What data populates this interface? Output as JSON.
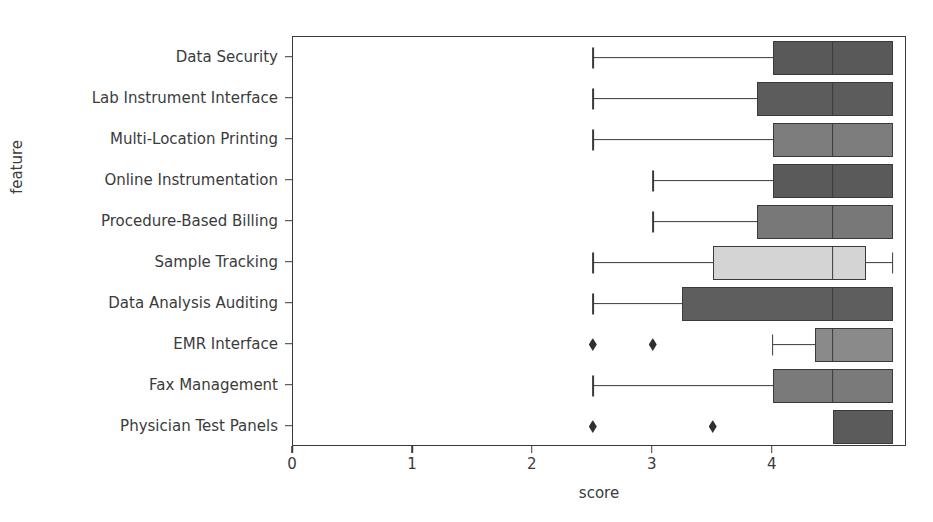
{
  "chart_data": {
    "type": "box",
    "title": "",
    "xlabel": "score",
    "ylabel": "feature",
    "xlim": [
      0,
      5.12
    ],
    "xticks": [
      0,
      1,
      2,
      3,
      4
    ],
    "xticklabels": [
      "0",
      "1",
      "2",
      "3",
      "4"
    ],
    "grid": false,
    "legend": null,
    "orientation": "horizontal",
    "categories": [
      "Data Security",
      "Lab Instrument Interface",
      "Multi-Location Printing",
      "Online Instrumentation",
      "Procedure-Based Billing",
      "Sample Tracking",
      "Data Analysis Auditing",
      "EMR Interface",
      "Fax Management",
      "Physician Test Panels"
    ],
    "boxes": [
      {
        "feature": "Data Security",
        "whisker_low": 2.5,
        "q1": 4.0,
        "median": 4.5,
        "q3": 5.0,
        "whisker_high": 5.0,
        "fliers": [],
        "fill": "#595959"
      },
      {
        "feature": "Lab Instrument Interface",
        "whisker_low": 2.5,
        "q1": 3.87,
        "median": 4.5,
        "q3": 5.0,
        "whisker_high": 5.0,
        "fliers": [],
        "fill": "#5c5c5c"
      },
      {
        "feature": "Multi-Location Printing",
        "whisker_low": 2.5,
        "q1": 4.0,
        "median": 4.5,
        "q3": 5.0,
        "whisker_high": 5.0,
        "fliers": [],
        "fill": "#7d7d7d"
      },
      {
        "feature": "Online Instrumentation",
        "whisker_low": 3.0,
        "q1": 4.0,
        "median": 4.5,
        "q3": 5.0,
        "whisker_high": 5.0,
        "fliers": [],
        "fill": "#5a5a5a"
      },
      {
        "feature": "Procedure-Based Billing",
        "whisker_low": 3.0,
        "q1": 3.87,
        "median": 4.5,
        "q3": 5.0,
        "whisker_high": 5.0,
        "fliers": [],
        "fill": "#787878"
      },
      {
        "feature": "Sample Tracking",
        "whisker_low": 2.5,
        "q1": 3.5,
        "median": 4.5,
        "q3": 4.78,
        "whisker_high": 5.0,
        "fliers": [],
        "fill": "#d4d4d4"
      },
      {
        "feature": "Data Analysis Auditing",
        "whisker_low": 2.5,
        "q1": 3.24,
        "median": 4.5,
        "q3": 5.0,
        "whisker_high": 5.0,
        "fliers": [],
        "fill": "#5e5e5e"
      },
      {
        "feature": "EMR Interface",
        "whisker_low": 4.0,
        "q1": 4.35,
        "median": 4.5,
        "q3": 5.0,
        "whisker_high": 5.0,
        "fliers": [
          2.5,
          3.0
        ],
        "fill": "#8a8a8a"
      },
      {
        "feature": "Fax Management",
        "whisker_low": 2.5,
        "q1": 4.0,
        "median": 4.5,
        "q3": 5.0,
        "whisker_high": 5.0,
        "fliers": [],
        "fill": "#7a7a7a"
      },
      {
        "feature": "Physician Test Panels",
        "whisker_low": 4.5,
        "q1": 4.5,
        "median": 4.5,
        "q3": 5.0,
        "whisker_high": 5.0,
        "fliers": [
          2.5,
          3.5
        ],
        "fill": "#5b5b5b"
      }
    ],
    "colors": {
      "axis": "#3a3a3a",
      "text": "#3b3b3b",
      "background": "#ffffff",
      "flier": "#2f2f2f"
    }
  }
}
